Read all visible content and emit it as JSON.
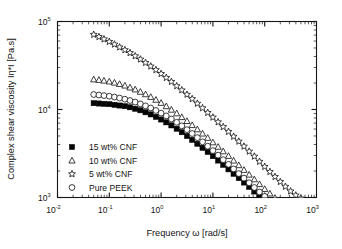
{
  "chart_data": {
    "type": "scatter",
    "title": "",
    "xlabel": "Frequency ω [rad/s]",
    "ylabel": "Complex shear viscosity Iη*I [Pa.s]",
    "xscale": "log",
    "yscale": "log",
    "xlim": [
      0.01,
      1000
    ],
    "ylim": [
      1000,
      100000
    ],
    "grid": false,
    "legend_position": "lower-left-inside",
    "xticks": [
      {
        "value": 0.01,
        "label": "10",
        "exponent": "-2"
      },
      {
        "value": 0.1,
        "label": "10",
        "exponent": "-1"
      },
      {
        "value": 1,
        "label": "10",
        "exponent": "0"
      },
      {
        "value": 10,
        "label": "10",
        "exponent": "1"
      },
      {
        "value": 100,
        "label": "10",
        "exponent": "2"
      },
      {
        "value": 1000,
        "label": "10",
        "exponent": "3"
      }
    ],
    "yticks": [
      {
        "value": 1000,
        "label": "10",
        "exponent": "3"
      },
      {
        "value": 10000,
        "label": "10",
        "exponent": "4"
      },
      {
        "value": 100000,
        "label": "10",
        "exponent": "5"
      }
    ],
    "series": [
      {
        "name": "15 wt% CNF",
        "marker": "filled-square",
        "color": "#050505",
        "x": [
          0.05,
          0.063,
          0.079,
          0.1,
          0.126,
          0.158,
          0.2,
          0.251,
          0.316,
          0.398,
          0.501,
          0.631,
          0.794,
          1.0,
          1.26,
          1.58,
          2.0,
          2.51,
          3.16,
          3.98,
          5.01,
          6.31,
          7.94,
          10.0,
          12.6,
          15.8,
          20.0,
          25.1,
          31.6,
          39.8,
          50.1,
          63.1,
          79.4,
          100.0,
          126.0,
          158.0,
          200.0,
          251.0,
          316.0,
          398.0,
          501.0
        ],
        "y": [
          11800,
          11700,
          11600,
          11500,
          11300,
          11100,
          10900,
          10600,
          10200,
          9800,
          9300,
          8800,
          8250,
          7700,
          7150,
          6600,
          6050,
          5520,
          5000,
          4520,
          4080,
          3670,
          3290,
          2950,
          2630,
          2350,
          2090,
          1860,
          1660,
          1480,
          1320,
          1170,
          1040,
          930,
          830,
          745,
          680,
          625,
          585,
          550,
          530
        ]
      },
      {
        "name": "10 wt% CNF",
        "marker": "open-triangle",
        "color": "#1b1b1b",
        "x": [
          0.05,
          0.063,
          0.079,
          0.1,
          0.126,
          0.158,
          0.2,
          0.251,
          0.316,
          0.398,
          0.501,
          0.631,
          0.794,
          1.0,
          1.26,
          1.58,
          2.0,
          2.51,
          3.16,
          3.98,
          5.01,
          6.31,
          7.94,
          10.0,
          12.6,
          15.8,
          20.0,
          25.1,
          31.6,
          39.8,
          50.1,
          63.1,
          79.4,
          100.0,
          126.0,
          158.0,
          200.0,
          251.0,
          316.0,
          398.0,
          501.0
        ],
        "y": [
          22000,
          21700,
          21300,
          20800,
          20200,
          19500,
          18700,
          17800,
          16900,
          15900,
          14900,
          13900,
          12900,
          11900,
          10900,
          9950,
          9050,
          8200,
          7400,
          6650,
          5960,
          5330,
          4760,
          4240,
          3770,
          3350,
          2970,
          2630,
          2330,
          2060,
          1820,
          1610,
          1420,
          1250,
          1110,
          990,
          890,
          815,
          760,
          720,
          700
        ]
      },
      {
        "name": "5 wt% CNF",
        "marker": "open-star",
        "color": "#1b1b1b",
        "x": [
          0.05,
          0.063,
          0.079,
          0.1,
          0.126,
          0.158,
          0.2,
          0.251,
          0.316,
          0.398,
          0.501,
          0.631,
          0.794,
          1.0,
          1.26,
          1.58,
          2.0,
          2.51,
          3.16,
          3.98,
          5.01,
          6.31,
          7.94,
          10.0,
          12.6,
          15.8,
          20.0,
          25.1,
          31.6,
          39.8,
          50.1,
          63.1,
          79.4,
          100.0,
          126.0,
          158.0,
          200.0,
          251.0,
          316.0,
          398.0,
          501.0
        ],
        "y": [
          71000,
          67000,
          63000,
          59000,
          55000,
          51000,
          47500,
          44000,
          40500,
          37200,
          34000,
          31000,
          28200,
          25500,
          23000,
          20700,
          18500,
          16600,
          14800,
          13200,
          11700,
          10400,
          9200,
          8150,
          7200,
          6350,
          5600,
          4930,
          4340,
          3810,
          3340,
          2930,
          2560,
          2240,
          1960,
          1720,
          1510,
          1330,
          1180,
          1060,
          980
        ]
      },
      {
        "name": "Pure PEEK",
        "marker": "open-circle",
        "color": "#1b1b1b",
        "x": [
          0.05,
          0.063,
          0.079,
          0.1,
          0.126,
          0.158,
          0.2,
          0.251,
          0.316,
          0.398,
          0.501,
          0.631,
          0.794,
          1.0,
          1.26,
          1.58,
          2.0,
          2.51,
          3.16,
          3.98,
          5.01,
          6.31,
          7.94,
          10.0,
          12.6,
          15.8,
          20.0,
          25.1,
          31.6,
          39.8,
          50.1,
          63.1,
          79.4,
          100.0,
          126.0,
          158.0,
          200.0,
          251.0,
          316.0,
          398.0,
          501.0
        ],
        "y": [
          14800,
          14600,
          14400,
          14150,
          13850,
          13500,
          13100,
          12650,
          12150,
          11600,
          11000,
          10400,
          9750,
          9100,
          8450,
          7800,
          7150,
          6520,
          5900,
          5330,
          4790,
          4290,
          3830,
          3410,
          3030,
          2690,
          2380,
          2110,
          1870,
          1660,
          1470,
          1300,
          1155,
          1030,
          920,
          830,
          755,
          700,
          660,
          630,
          615
        ]
      }
    ]
  },
  "legend": {
    "entries": [
      {
        "label": "15 wt% CNF",
        "marker": "filled-square"
      },
      {
        "label": "10 wt% CNF",
        "marker": "open-triangle"
      },
      {
        "label": "5 wt% CNF",
        "marker": "open-star"
      },
      {
        "label": "Pure PEEK",
        "marker": "open-circle"
      }
    ]
  }
}
